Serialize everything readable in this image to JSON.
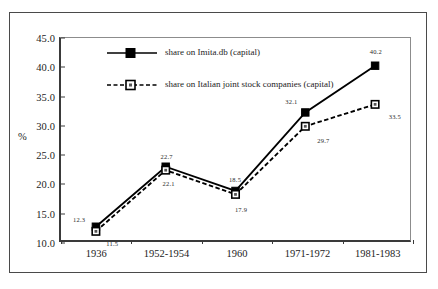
{
  "chart_data": {
    "type": "line",
    "title": "",
    "xlabel": "",
    "ylabel": "%",
    "ylim": [
      10.0,
      45.0
    ],
    "yticks": [
      "10.0",
      "15.0",
      "20.0",
      "25.0",
      "30.0",
      "35.0",
      "40.0",
      "45.0"
    ],
    "grid": false,
    "legend_position": "inside-top-left",
    "categories": [
      "1936",
      "1952-1954",
      "1960",
      "1971-1972",
      "1981-1983"
    ],
    "series": [
      {
        "name": "share on Imita.db (capital)",
        "marker": "filled-square",
        "line_style": "solid",
        "color": "#000000",
        "values": [
          12.3,
          22.7,
          18.5,
          32.1,
          40.2
        ],
        "labels": [
          "12.3",
          "22.7",
          "18.5",
          "32.1",
          "40.2"
        ]
      },
      {
        "name": "share on Italian joint stock companies (capital)",
        "marker": "open-square",
        "line_style": "dashed",
        "color": "#000000",
        "values": [
          11.5,
          22.1,
          17.9,
          29.7,
          33.5
        ],
        "labels": [
          "11.5",
          "22.1",
          "17.9",
          "29.7",
          "33.5"
        ]
      }
    ]
  },
  "legend": {
    "entries": [
      {
        "label": "share on Imita.db (capital)"
      },
      {
        "label": "share on Italian joint stock companies (capital)"
      }
    ]
  }
}
